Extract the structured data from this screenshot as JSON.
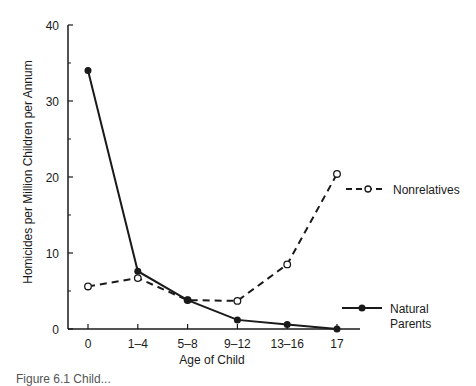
{
  "chart_data": {
    "type": "line",
    "title": "",
    "xlabel": "Age of Child",
    "ylabel": "Homicides per Million Children per Annum",
    "categories": [
      "0",
      "1–4",
      "5–8",
      "9–12",
      "13–16",
      "17"
    ],
    "ylim": [
      0,
      40
    ],
    "yticks": [
      "0",
      "10",
      "20",
      "30",
      "40"
    ],
    "yminor_ticks": [
      5,
      15,
      25,
      35
    ],
    "grid": false,
    "series": [
      {
        "name": "Nonrelatives",
        "style": "dashed",
        "marker": "open-circle",
        "values": [
          5.6,
          6.7,
          3.8,
          3.7,
          8.5,
          20.4
        ]
      },
      {
        "name": "Natural Parents",
        "legend_lines": [
          "Natural",
          "Parents"
        ],
        "style": "solid",
        "marker": "filled-circle",
        "values": [
          34,
          7.6,
          3.8,
          1.2,
          0.6,
          0
        ]
      }
    ],
    "legend": "right, beside line ends"
  },
  "caption": "Figure 6.1  Child..."
}
